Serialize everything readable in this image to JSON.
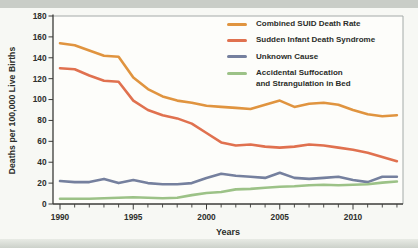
{
  "figure": {
    "x_axis_title": "Years",
    "y_axis_title": "Deaths per 100,000 Live Births"
  },
  "chart_data": {
    "type": "line",
    "title": "",
    "xlabel": "Years",
    "ylabel": "Deaths per 100,000 Live Births",
    "ylim": [
      0,
      180
    ],
    "y_tick_interval": 20,
    "y_ticks": [
      0,
      20,
      40,
      60,
      80,
      100,
      120,
      140,
      160,
      180
    ],
    "x_major_ticks": [
      1990,
      1995,
      2000,
      2005,
      2010
    ],
    "x_minor_tick_interval_years": 1,
    "grid": false,
    "legend_position": "top-right",
    "x": [
      1990,
      1991,
      1992,
      1993,
      1994,
      1995,
      1996,
      1997,
      1998,
      1999,
      2000,
      2001,
      2002,
      2003,
      2004,
      2005,
      2006,
      2007,
      2008,
      2009,
      2010,
      2011,
      2012,
      2013
    ],
    "series": [
      {
        "name": "Combined SUID Death Rate",
        "legend_lines": [
          "Combined SUID Death Rate"
        ],
        "color": "#E0943F",
        "values": [
          154,
          152,
          147,
          142,
          141,
          121,
          110,
          103,
          99,
          97,
          94,
          93,
          92,
          91,
          95,
          99,
          93,
          96,
          97,
          95,
          90,
          86,
          84,
          85
        ]
      },
      {
        "name": "Sudden Infant Death Syndrome",
        "legend_lines": [
          "Sudden Infant Death Syndrome"
        ],
        "color": "#E0714F",
        "values": [
          130,
          129,
          123,
          118,
          117,
          99,
          90,
          85,
          82,
          77,
          68,
          59,
          56,
          57,
          55,
          54,
          55,
          57,
          56,
          54,
          52,
          49,
          45,
          41
        ]
      },
      {
        "name": "Unknown Cause",
        "legend_lines": [
          "Unknown Cause"
        ],
        "color": "#75809E",
        "values": [
          22,
          21,
          21,
          24,
          20,
          23,
          20,
          19,
          19,
          20,
          25,
          29,
          27,
          26,
          25,
          30,
          25,
          24,
          25,
          26,
          23,
          21,
          26,
          26
        ]
      },
      {
        "name": "Accidental Suffocation and Strangulation in Bed",
        "legend_lines": [
          "Accidental Suffocation",
          "and Strangulation in Bed"
        ],
        "color": "#9CC287",
        "values": [
          5,
          5,
          5,
          5.5,
          6,
          6.5,
          6,
          5.5,
          6,
          8.5,
          10.5,
          11.5,
          14,
          14.5,
          15.5,
          16.5,
          17,
          18,
          18.5,
          18,
          18.5,
          19,
          20.5,
          21.5
        ]
      }
    ]
  }
}
